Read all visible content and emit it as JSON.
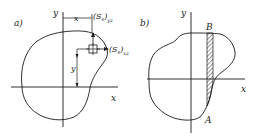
{
  "panels": [
    {
      "id": "a",
      "label": "a)",
      "axis_y_label": "y",
      "axis_x_label": "x",
      "dim_x_label": "x",
      "dim_y_label": "y",
      "moment_yz_label": "(S",
      "moment_yz_sub": "s",
      "moment_yz_suffix": ")",
      "moment_yz_subscript": "yz",
      "moment_xz_label": "(S",
      "moment_xz_sub": "s",
      "moment_xz_suffix": ")",
      "moment_xz_subscript": "xz"
    },
    {
      "id": "b",
      "label": "b)",
      "axis_y_label": "y",
      "axis_x_label": "x",
      "point_top": "B",
      "point_bottom": "A"
    }
  ],
  "colors": {
    "ink": "#1a1a1a",
    "background": "#ffffff"
  }
}
